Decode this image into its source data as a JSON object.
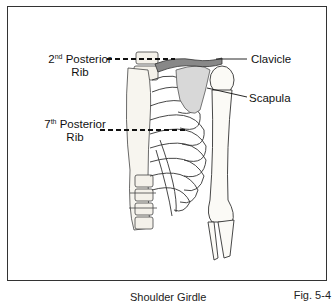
{
  "figure": {
    "labels": {
      "posterior_rib_2": {
        "ordinal": "2",
        "suffix": "nd",
        "word": "Posterior",
        "line2": "Rib"
      },
      "posterior_rib_7": {
        "ordinal": "7",
        "suffix": "th",
        "word": "Posterior",
        "line2": "Rib"
      },
      "clavicle": "Clavicle",
      "scapula": "Scapula"
    },
    "caption": "Shoulder Girdle",
    "figure_number": "Fig. 5-4"
  }
}
